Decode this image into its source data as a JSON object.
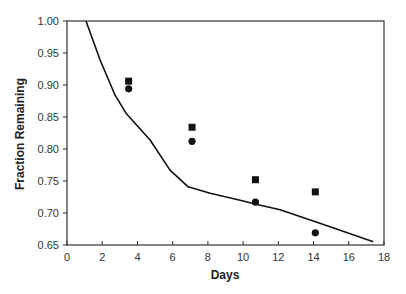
{
  "chart_data": {
    "type": "scatter",
    "title": "",
    "xlabel": "Days",
    "ylabel": "Fraction Remaining",
    "xlim": [
      0,
      18
    ],
    "ylim": [
      0.65,
      1.0
    ],
    "x_ticks": [
      0,
      2,
      4,
      6,
      8,
      10,
      12,
      14,
      16,
      18
    ],
    "y_ticks": [
      0.65,
      0.7,
      0.75,
      0.8,
      0.85,
      0.9,
      0.95,
      1.0
    ],
    "x_tick_labels": [
      "0",
      "2",
      "4",
      "6",
      "8",
      "10",
      "12",
      "14",
      "16",
      "18"
    ],
    "y_tick_labels": [
      "0.65",
      "0.70",
      "0.75",
      "0.80",
      "0.85",
      "0.90",
      "0.95",
      "1.00"
    ],
    "grid": false,
    "legend": null,
    "series": [
      {
        "name": "squares",
        "marker": "square",
        "x": [
          3.5,
          7.1,
          10.7,
          14.1
        ],
        "y": [
          0.906,
          0.834,
          0.752,
          0.733
        ]
      },
      {
        "name": "circles",
        "marker": "circle",
        "x": [
          3.5,
          7.1,
          10.7,
          14.1
        ],
        "y": [
          0.894,
          0.812,
          0.717,
          0.669
        ]
      },
      {
        "name": "model curve",
        "marker": "line",
        "x": [
          1.08,
          1.88,
          2.73,
          3.35,
          4.72,
          5.85,
          6.88,
          8.13,
          9.83,
          10.68,
          12.1,
          14.15,
          15.51,
          17.39
        ],
        "y": [
          1.0,
          0.939,
          0.884,
          0.856,
          0.814,
          0.767,
          0.741,
          0.731,
          0.72,
          0.714,
          0.705,
          0.686,
          0.673,
          0.655
        ]
      }
    ]
  }
}
